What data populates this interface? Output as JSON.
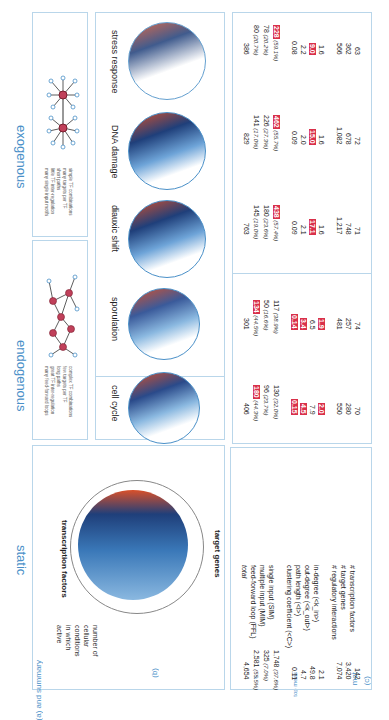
{
  "figure": {
    "orientation": "rotated 90 degrees",
    "sections": [
      {
        "id": "static",
        "heading": "static"
      },
      {
        "id": "endogenous",
        "heading": "endogenous"
      },
      {
        "id": "exogenous",
        "heading": "exogenous"
      }
    ],
    "panel_labels": {
      "a": "(a) and summary",
      "b": "(b)",
      "c": "(c)",
      "c_group_stats": "s",
      "c_group_topology": "top meas",
      "c_group_motifs": "mot"
    },
    "summary": {
      "static": {
        "tf_label": "transcription factors",
        "tg_label": "target genes",
        "conditions_label": [
          "number of",
          "cellular",
          "conditions",
          "in which",
          "active"
        ],
        "ring_percentages": [
          "10.3%",
          "20%",
          "27.1%",
          "42.3%",
          "37.5%",
          "181.5%",
          "17.5%",
          "80.5%",
          "80.0%"
        ]
      },
      "endogenous": {
        "bullets": [
          "complex TF combinations",
          "few targets per TF",
          "long paths",
          "great TF inter-regulation",
          "many feed-forward loops"
        ]
      },
      "exogenous": {
        "bullets": [
          "simple TF combinations",
          "many targets per TF",
          "short paths",
          "little TF inter-regulation",
          "many single input motifs"
        ]
      }
    },
    "networks": [
      {
        "name": "static"
      },
      {
        "name": "cell cycle"
      },
      {
        "name": "sporulation"
      },
      {
        "name": "diauxic shift"
      },
      {
        "name": "DNA damage"
      },
      {
        "name": "stress response"
      }
    ],
    "table": {
      "row_labels": {
        "stats": [
          "# transcription factors",
          "# target genes",
          "# regulatory interactions"
        ],
        "topology": [
          "in-degree (<k_in>)",
          "out-degree (<k_out>)",
          "path length (<l>)",
          "clustering coefficient (<C>)"
        ],
        "motifs": [
          "single input (SIM)",
          "multiple input (MIM)",
          "feed-forward loop (FFL)",
          "total"
        ]
      },
      "columns": [
        {
          "name": "static",
          "stats": [
            "142",
            "3,420",
            "7,074"
          ],
          "topology": [
            "2.1",
            "49.8",
            "4.7",
            "0.11"
          ],
          "topology_highlight": [
            false,
            false,
            false,
            false
          ],
          "motifs": [
            "1,748",
            "325",
            "2,581",
            "4,654"
          ],
          "motif_pct": [
            "(37.6%)",
            "(7.0%)",
            "(55.5%)",
            ""
          ],
          "motif_highlight": [
            false,
            false,
            false,
            false
          ]
        },
        {
          "name": "cell cycle",
          "stats": [
            "70",
            "280",
            "550"
          ],
          "topology": [
            "2.0",
            "7.9",
            "4.5",
            "0.15"
          ],
          "topology_highlight": [
            true,
            false,
            true,
            true
          ],
          "motifs": [
            "130",
            "96",
            "180",
            "406"
          ],
          "motif_pct": [
            "(32.0%)",
            "(23.7%)",
            "(44.3%)",
            ""
          ],
          "motif_highlight": [
            false,
            false,
            true,
            false
          ]
        },
        {
          "name": "sporulation",
          "stats": [
            "74",
            "257",
            "481"
          ],
          "topology": [
            "1.9",
            "6.5",
            "3.4",
            "0.14"
          ],
          "topology_highlight": [
            true,
            false,
            true,
            true
          ],
          "motifs": [
            "117",
            "50",
            "134",
            "301"
          ],
          "motif_pct": [
            "(38.9%)",
            "(16.6%)",
            "(44.5%)",
            ""
          ],
          "motif_highlight": [
            false,
            false,
            true,
            false
          ]
        },
        {
          "name": "diauxic shift",
          "stats": [
            "71",
            "748",
            "1,217"
          ],
          "topology": [
            "1.6",
            "17.1",
            "2.1",
            "0.09"
          ],
          "topology_highlight": [
            false,
            true,
            false,
            false
          ],
          "motifs": [
            "438",
            "180",
            "145",
            "763"
          ],
          "motif_pct": [
            "(57.4%)",
            "(23.6%)",
            "(19.0%)",
            ""
          ],
          "motif_highlight": [
            true,
            false,
            false,
            false
          ]
        },
        {
          "name": "DNA damage",
          "stats": [
            "72",
            "678",
            "1,082"
          ],
          "topology": [
            "1.6",
            "15.0",
            "2.0",
            "0.09"
          ],
          "topology_highlight": [
            false,
            true,
            false,
            false
          ],
          "motifs": [
            "462",
            "226",
            "141",
            "829"
          ],
          "motif_pct": [
            "(55.7%)",
            "(27.3%)",
            "(17.0%)",
            ""
          ],
          "motif_highlight": [
            true,
            false,
            false,
            false
          ]
        },
        {
          "name": "stress response",
          "stats": [
            "63",
            "362",
            "566"
          ],
          "topology": [
            "1.6",
            "9.0",
            "2.2",
            "0.08"
          ],
          "topology_highlight": [
            false,
            true,
            false,
            false
          ],
          "motifs": [
            "228",
            "78",
            "80",
            "386"
          ],
          "motif_pct": [
            "(59.1%)",
            "(20.2%)",
            "(20.7%)",
            ""
          ],
          "motif_highlight": [
            true,
            false,
            false,
            false
          ]
        }
      ]
    },
    "colors": {
      "panel_border": "#b9d6ea",
      "heading": "#4a90c8",
      "highlight": "#d9304a",
      "tf_arc": "#d9502a",
      "tg_lines": "#3a78b8"
    }
  }
}
